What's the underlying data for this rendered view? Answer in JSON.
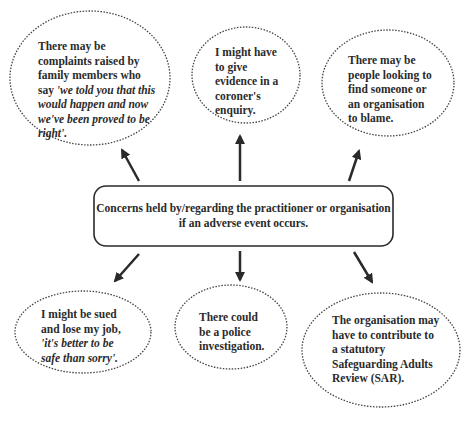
{
  "diagram": {
    "central_node": {
      "line1": "Concerns held by/regarding the practitioner or organisation",
      "line2": "if an adverse event occurs."
    },
    "nodes": [
      {
        "id": "family-complaints",
        "position": "top-left",
        "text_plain": "There may be complaints raised by family members who say",
        "text_quote": "'we told you that this would happen and now we've been proved to be right'."
      },
      {
        "id": "coroner-evidence",
        "position": "top-center",
        "text_plain": "I might have to give evidence in a coroner's enquiry."
      },
      {
        "id": "blame",
        "position": "top-right",
        "text_plain": "There may be people looking to find someone or an organisation to blame."
      },
      {
        "id": "sued",
        "position": "bottom-left",
        "text_plain": "I might be sued and lose my job,",
        "text_quote": "'it's better to be safe than sorry'."
      },
      {
        "id": "police",
        "position": "bottom-center",
        "text_plain": "There could be a police investigation."
      },
      {
        "id": "sar",
        "position": "bottom-right",
        "text_plain": "The organisation may have to contribute to a statutory Safeguarding Adults Review (SAR)."
      }
    ],
    "colors": {
      "line": "#2a2a2a",
      "background": "#ffffff"
    }
  }
}
